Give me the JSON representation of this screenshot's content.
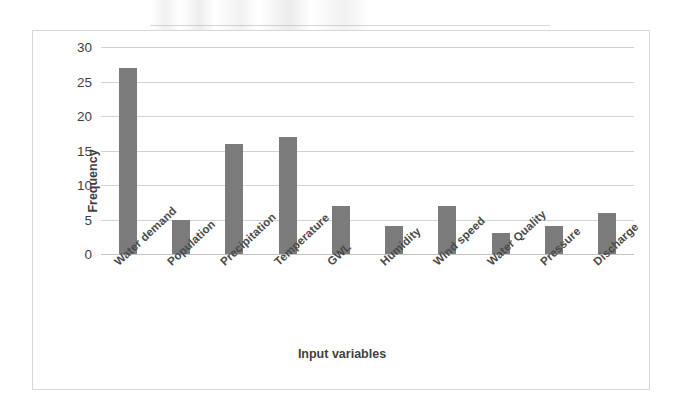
{
  "chart_data": {
    "type": "bar",
    "title": "",
    "xlabel": "Input variables",
    "ylabel": "Frequency",
    "categories": [
      "Water demand",
      "Population",
      "Precipitation",
      "Temperature",
      "GWL",
      "Humidity",
      "Wind speed",
      "Water Quality",
      "Pressure",
      "Discharge"
    ],
    "values": [
      27,
      5,
      16,
      17,
      7,
      4,
      7,
      3,
      4,
      6
    ],
    "yticks": [
      0,
      5,
      10,
      15,
      20,
      25,
      30
    ],
    "ylim": [
      0,
      30
    ],
    "grid": true,
    "legend": false,
    "bar_color": "#7b7b7b",
    "gridline_color": "#d2d2d2",
    "axis_text_color": "#3f3f3f"
  }
}
